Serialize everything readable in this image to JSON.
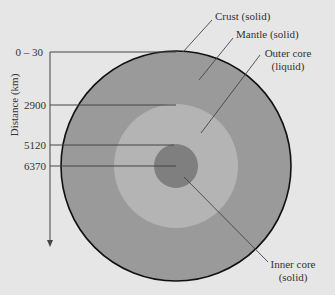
{
  "diagram": {
    "type": "earth-layers-cross-section",
    "axis": {
      "label": "Distance (km)",
      "ticks": [
        {
          "label": "0 – 30",
          "y": 52
        },
        {
          "label": "2900",
          "y": 105
        },
        {
          "label": "5120",
          "y": 145
        },
        {
          "label": "6370",
          "y": 166
        }
      ]
    },
    "layers": [
      {
        "name": "Crust",
        "state": "solid",
        "label_line1": "Crust (solid)",
        "color": "#9a9a9a"
      },
      {
        "name": "Mantle",
        "state": "solid",
        "label_line1": "Mantle (solid)",
        "color": "#9a9a9a"
      },
      {
        "name": "Outer core",
        "state": "liquid",
        "label_line1": "Outer core",
        "label_line2": "(liquid)",
        "color": "#b4b4b4"
      },
      {
        "name": "Inner core",
        "state": "solid",
        "label_line1": "Inner core",
        "label_line2": "(solid)",
        "color": "#7f7f7f"
      }
    ],
    "colors": {
      "background": "#e6e6e6",
      "mantle": "#9a9a9a",
      "outer_core": "#b4b4b4",
      "inner_core": "#7f7f7f",
      "outline": "#111111",
      "lines": "#444444"
    }
  }
}
